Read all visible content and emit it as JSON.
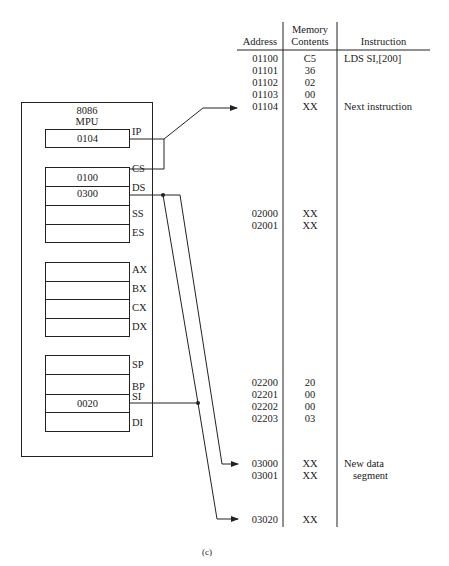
{
  "mpu": {
    "title_line1": "8086",
    "title_line2": "MPU",
    "registers": {
      "IP": {
        "label": "IP",
        "value": "0104"
      },
      "CS": {
        "label": "CS",
        "value": "0100"
      },
      "DS": {
        "label": "DS",
        "value": "0300"
      },
      "SS": {
        "label": "SS",
        "value": ""
      },
      "ES": {
        "label": "ES",
        "value": ""
      },
      "AX": {
        "label": "AX",
        "value": ""
      },
      "BX": {
        "label": "BX",
        "value": ""
      },
      "CX": {
        "label": "CX",
        "value": ""
      },
      "DX": {
        "label": "DX",
        "value": ""
      },
      "SP": {
        "label": "SP",
        "value": ""
      },
      "BP": {
        "label": "BP",
        "value": ""
      },
      "SI": {
        "label": "SI",
        "value": "0020"
      },
      "DI": {
        "label": "DI",
        "value": ""
      }
    }
  },
  "memory_table": {
    "headers": {
      "address": "Address",
      "contents_line1": "Memory",
      "contents_line2": "Contents",
      "instruction": "Instruction"
    },
    "rows": [
      {
        "address": "01100",
        "contents": "C5",
        "instruction": "LDS SI,[200]"
      },
      {
        "address": "01101",
        "contents": "36",
        "instruction": ""
      },
      {
        "address": "01102",
        "contents": "02",
        "instruction": ""
      },
      {
        "address": "01103",
        "contents": "00",
        "instruction": ""
      },
      {
        "address": "01104",
        "contents": "XX",
        "instruction": "Next instruction"
      },
      {
        "address": "02000",
        "contents": "XX",
        "instruction": ""
      },
      {
        "address": "02001",
        "contents": "XX",
        "instruction": ""
      },
      {
        "address": "02200",
        "contents": "20",
        "instruction": ""
      },
      {
        "address": "02201",
        "contents": "00",
        "instruction": ""
      },
      {
        "address": "02202",
        "contents": "00",
        "instruction": ""
      },
      {
        "address": "02203",
        "contents": "03",
        "instruction": ""
      },
      {
        "address": "03000",
        "contents": "XX",
        "instruction": "New data"
      },
      {
        "address": "03001",
        "contents": "XX",
        "instruction": "segment"
      },
      {
        "address": "03020",
        "contents": "XX",
        "instruction": ""
      }
    ]
  },
  "caption": "(c)"
}
